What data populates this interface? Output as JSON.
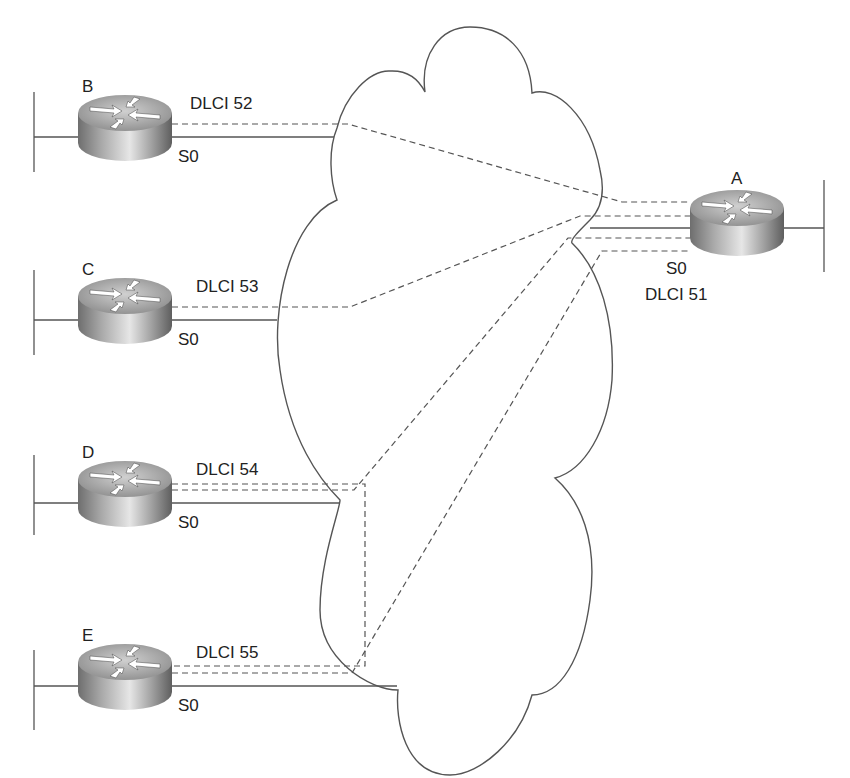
{
  "diagram": {
    "cloud": {
      "label": ""
    },
    "routers": [
      {
        "id": "A",
        "label": "A",
        "interface": "S0",
        "dlci": "DLCI 51",
        "role": "hub"
      },
      {
        "id": "B",
        "label": "B",
        "interface": "S0",
        "dlci": "DLCI 52"
      },
      {
        "id": "C",
        "label": "C",
        "interface": "S0",
        "dlci": "DLCI 53"
      },
      {
        "id": "D",
        "label": "D",
        "interface": "S0",
        "dlci": "DLCI 54"
      },
      {
        "id": "E",
        "label": "E",
        "interface": "S0",
        "dlci": "DLCI 55"
      }
    ],
    "pvcs": [
      {
        "from": "B",
        "to": "A"
      },
      {
        "from": "C",
        "to": "A"
      },
      {
        "from": "D",
        "to": "A"
      },
      {
        "from": "E",
        "to": "A"
      },
      {
        "from": "D",
        "to": "E"
      }
    ],
    "colors": {
      "line": "#555555",
      "router_top": "#b8b8b8",
      "router_body": "#8a8a8a"
    }
  }
}
